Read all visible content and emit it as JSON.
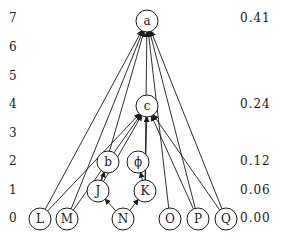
{
  "diagram": {
    "type": "hierarchy",
    "levels": [
      {
        "label": "7",
        "y": 19
      },
      {
        "label": "6",
        "y": 48
      },
      {
        "label": "5",
        "y": 77
      },
      {
        "label": "4",
        "y": 105
      },
      {
        "label": "3",
        "y": 134
      },
      {
        "label": "2",
        "y": 162
      },
      {
        "label": "1",
        "y": 191
      },
      {
        "label": "0",
        "y": 219
      }
    ],
    "values": [
      {
        "label": "0.41",
        "y": 19
      },
      {
        "label": "0.24",
        "y": 105
      },
      {
        "label": "0.12",
        "y": 162
      },
      {
        "label": "0.06",
        "y": 191
      },
      {
        "label": "0.00",
        "y": 219
      }
    ],
    "nodes": [
      {
        "id": "a",
        "label": "a",
        "x": 147,
        "y": 21
      },
      {
        "id": "c",
        "label": "c",
        "x": 147,
        "y": 106
      },
      {
        "id": "b",
        "label": "b",
        "x": 108,
        "y": 162
      },
      {
        "id": "phi",
        "label": "ϕ",
        "x": 138,
        "y": 162
      },
      {
        "id": "J",
        "label": "J",
        "x": 98,
        "y": 191
      },
      {
        "id": "K",
        "label": "K",
        "x": 145,
        "y": 191
      },
      {
        "id": "N",
        "label": "N",
        "x": 123,
        "y": 219
      },
      {
        "id": "L",
        "label": "L",
        "x": 40,
        "y": 219
      },
      {
        "id": "M",
        "label": "M",
        "x": 67,
        "y": 219
      },
      {
        "id": "O",
        "label": "O",
        "x": 170,
        "y": 219
      },
      {
        "id": "P",
        "label": "P",
        "x": 198,
        "y": 219
      },
      {
        "id": "Q",
        "label": "Q",
        "x": 226,
        "y": 219
      }
    ],
    "edges": [
      {
        "from": "N",
        "to": "J"
      },
      {
        "from": "N",
        "to": "K"
      },
      {
        "from": "J",
        "to": "b"
      },
      {
        "from": "K",
        "to": "phi"
      },
      {
        "from": "J",
        "to": "c"
      },
      {
        "from": "K",
        "to": "c"
      },
      {
        "from": "M",
        "to": "c"
      },
      {
        "from": "P",
        "to": "c"
      },
      {
        "from": "L",
        "to": "a"
      },
      {
        "from": "M",
        "to": "a"
      },
      {
        "from": "J",
        "to": "a"
      },
      {
        "from": "K",
        "to": "a"
      },
      {
        "from": "O",
        "to": "a"
      },
      {
        "from": "P",
        "to": "a"
      },
      {
        "from": "Q",
        "to": "a"
      },
      {
        "from": "L",
        "to": "c"
      },
      {
        "from": "Q",
        "to": "c"
      }
    ]
  }
}
